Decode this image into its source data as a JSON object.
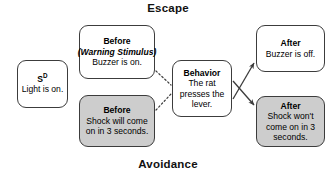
{
  "diagram": {
    "top_label": "Escape",
    "bottom_label": "Avoidance",
    "nodes": {
      "sd": {
        "title": "S",
        "title_superscript": "D",
        "body": "Light is on."
      },
      "before_warning": {
        "title": "Before",
        "subtitle": "(Warning Stimulus)",
        "body": "Buzzer is on."
      },
      "before_shock": {
        "title": "Before",
        "body": "Shock will come on in 3 seconds."
      },
      "behavior": {
        "title": "Behavior",
        "body": "The rat presses the lever."
      },
      "after_buzzer": {
        "title": "After",
        "body": "Buzzer is off."
      },
      "after_shock": {
        "title": "After",
        "body": "Shock won't come on in 3 seconds."
      }
    },
    "colors": {
      "shaded_fill": "#cdcdcd",
      "plain_fill": "#ffffff",
      "border": "#3c3c3c",
      "text": "#000000",
      "connector": "#3c3c3c"
    }
  }
}
